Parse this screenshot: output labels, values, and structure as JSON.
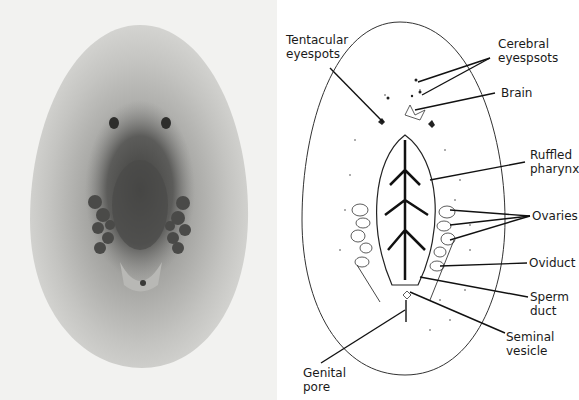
{
  "figure": {
    "photo": {
      "description": "Micrograph of flatworm specimen",
      "background": "#f2f2f0"
    },
    "drawing": {
      "description": "Labeled line drawing of flatworm anatomy",
      "labels": {
        "tentacular_eyespots": "Tentacular\neyespots",
        "cerebral_eyespots": "Cerebral\neyespsots",
        "brain": "Brain",
        "ruffled_pharynx": "Ruffled\npharynx",
        "ovaries": "Ovaries",
        "oviduct": "Oviduct",
        "sperm_duct": "Sperm\nduct",
        "seminal_vesicle": "Seminal\nvesicle",
        "genital_pore": "Genital\npore"
      }
    }
  }
}
